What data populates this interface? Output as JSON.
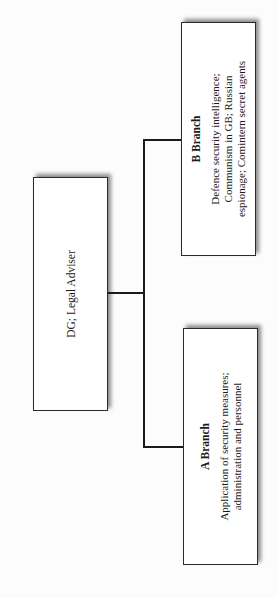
{
  "org_chart": {
    "root": {
      "label": "DG; Legal Adviser"
    },
    "branches": [
      {
        "title": "A Branch",
        "description": "Application of security measures; administration and personnel"
      },
      {
        "title": "B Branch",
        "description": "Defence security intelligence; Communism in GB; Russian espionage; Comintern secret agents"
      }
    ],
    "orientation": "rotated 90° counter-clockwise"
  }
}
